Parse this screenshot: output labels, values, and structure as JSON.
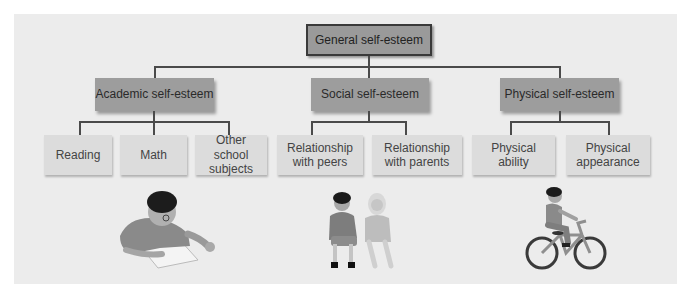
{
  "diagram": {
    "root": {
      "label": "General self-esteem"
    },
    "categories": [
      {
        "label": "Academic self-esteem",
        "children": [
          {
            "label": "Reading"
          },
          {
            "label": "Math"
          },
          {
            "label": "Other school subjects"
          }
        ],
        "illustration": "child-reading-book"
      },
      {
        "label": "Social self-esteem",
        "children": [
          {
            "label": "Relationship with peers"
          },
          {
            "label": "Relationship with parents"
          }
        ],
        "illustration": "two-children-sitting"
      },
      {
        "label": "Physical self-esteem",
        "children": [
          {
            "label": "Physical ability"
          },
          {
            "label": "Physical appearance"
          }
        ],
        "illustration": "child-riding-bicycle"
      }
    ]
  },
  "colors": {
    "panel_bg": "#ececec",
    "root_box": "#9a9a9a",
    "category_box": "#9d9d9d",
    "leaf_box": "#dcdcdc",
    "connector": "#4a4a4a"
  }
}
